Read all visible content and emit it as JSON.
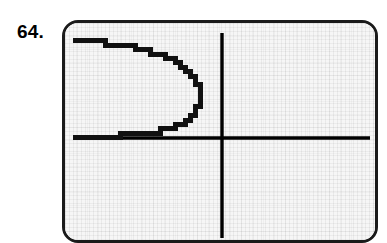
{
  "figure": {
    "exercise_number": "64.",
    "device": "graphing-calculator-screen"
  },
  "colors": {
    "ink": "#000000",
    "curve": "#111111",
    "screen_background": "#f6f6f6",
    "bezel": "#1a1a1a",
    "page_background": "#ffffff"
  },
  "chart_data": {
    "type": "line",
    "title": "",
    "subtitle": "",
    "xlabel": "",
    "ylabel": "",
    "grid": false,
    "legend_position": "none",
    "axes": {
      "x_axis_visible": true,
      "y_axis_visible": true,
      "x_axis_screen_y": 115,
      "y_axis_screen_x": 157,
      "xlim": [
        -10,
        10
      ],
      "ylim": [
        -10,
        10
      ],
      "tick_labels_x": [],
      "tick_labels_y": []
    },
    "annotations": [],
    "series": [
      {
        "name": "left-opening-parabola-upper-branch",
        "comment": "vertex at right; branch sweeps up and to the left",
        "x": [
          132,
          127,
          120,
          112,
          104,
          96,
          88,
          80,
          72,
          64,
          56,
          48,
          40,
          32,
          24,
          16,
          10
        ],
        "y": [
          60,
          52,
          45,
          39,
          35,
          32,
          29,
          27,
          25,
          23,
          22,
          21,
          20,
          19,
          18,
          17,
          17
        ]
      },
      {
        "name": "left-opening-parabola-vertex",
        "comment": "rightmost turning point of the parabola",
        "x": [
          132,
          134,
          135,
          134,
          132
        ],
        "y": [
          60,
          66,
          73,
          80,
          86
        ]
      },
      {
        "name": "left-opening-parabola-lower-branch",
        "comment": "branch sweeps down and to the left toward the x-axis",
        "x": [
          132,
          127,
          120,
          112,
          104,
          96,
          88,
          80,
          72,
          64,
          56,
          48,
          40,
          32,
          24,
          16,
          10
        ],
        "y": [
          86,
          93,
          99,
          103,
          106,
          108,
          109,
          110,
          111,
          112,
          112,
          113,
          113,
          113,
          114,
          114,
          114
        ]
      }
    ]
  }
}
